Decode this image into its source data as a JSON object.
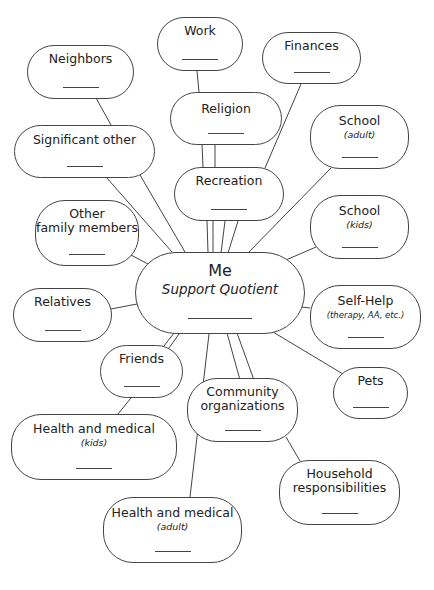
{
  "diagram": {
    "type": "mind-map",
    "center": {
      "id": "me",
      "title": "Me",
      "subtitle": "Support Quotient",
      "blank": "________"
    },
    "nodes": [
      {
        "id": "work",
        "title": "Work",
        "subtitle": ""
      },
      {
        "id": "neighbors",
        "title": "Neighbors",
        "subtitle": ""
      },
      {
        "id": "finances",
        "title": "Finances",
        "subtitle": ""
      },
      {
        "id": "religion",
        "title": "Religion",
        "subtitle": ""
      },
      {
        "id": "significant-other",
        "title": "Significant other",
        "subtitle": ""
      },
      {
        "id": "school-adult",
        "title": "School",
        "subtitle": "(adult)"
      },
      {
        "id": "recreation",
        "title": "Recreation",
        "subtitle": ""
      },
      {
        "id": "other-family",
        "title": "Other",
        "title2": "family members",
        "subtitle": ""
      },
      {
        "id": "school-kids",
        "title": "School",
        "subtitle": "(kids)"
      },
      {
        "id": "relatives",
        "title": "Relatives",
        "subtitle": ""
      },
      {
        "id": "self-help",
        "title": "Self-Help",
        "subtitle": "(therapy, AA, etc.)"
      },
      {
        "id": "friends",
        "title": "Friends",
        "subtitle": ""
      },
      {
        "id": "pets",
        "title": "Pets",
        "subtitle": ""
      },
      {
        "id": "community",
        "title": "Community",
        "title2": "organizations",
        "subtitle": ""
      },
      {
        "id": "health-kids",
        "title": "Health and medical",
        "subtitle": "(kids)"
      },
      {
        "id": "household",
        "title": "Household",
        "title2": "responsibilities",
        "subtitle": ""
      },
      {
        "id": "health-adult",
        "title": "Health and medical",
        "subtitle": "(adult)"
      }
    ],
    "edges": [
      [
        "work",
        "religion"
      ],
      [
        "religion",
        "recreation"
      ],
      [
        "religion",
        "recreation"
      ],
      [
        "recreation",
        "me"
      ],
      [
        "recreation",
        "me"
      ],
      [
        "recreation",
        "me"
      ],
      [
        "recreation",
        "me"
      ],
      [
        "finances",
        "me"
      ],
      [
        "neighbors",
        "significant-other"
      ],
      [
        "significant-other",
        "me"
      ],
      [
        "significant-other",
        "me"
      ],
      [
        "school-adult",
        "me"
      ],
      [
        "school-kids",
        "me"
      ],
      [
        "other-family",
        "me"
      ],
      [
        "relatives",
        "me"
      ],
      [
        "self-help",
        "me"
      ],
      [
        "pets",
        "me"
      ],
      [
        "friends",
        "me"
      ],
      [
        "friends",
        "me"
      ],
      [
        "friends",
        "health-kids"
      ],
      [
        "community",
        "me"
      ],
      [
        "community",
        "me"
      ],
      [
        "community",
        "household"
      ],
      [
        "health-adult",
        "me"
      ]
    ],
    "line_color": "#444444",
    "background": "#ffffff"
  }
}
